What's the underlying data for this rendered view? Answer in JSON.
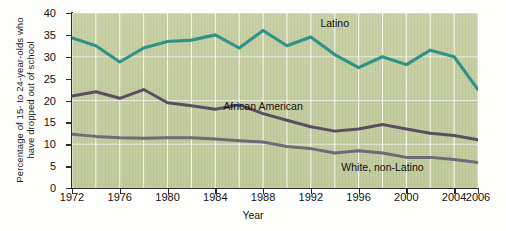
{
  "chart_data": {
    "type": "line",
    "title": "",
    "xlabel": "Year",
    "ylabel": "Percentage of 15- to 24-year-olds who have dropped out of school",
    "ylabel_line1": "Percentage of 15- to 24-year-olds who",
    "ylabel_line2": "have dropped out of school",
    "xlim": [
      1972,
      2006
    ],
    "ylim": [
      0,
      40
    ],
    "ytick_labels": [
      "0",
      "5",
      "10",
      "15",
      "20",
      "25",
      "30",
      "35",
      "40"
    ],
    "yticks": [
      0,
      5,
      10,
      15,
      20,
      25,
      30,
      35,
      40
    ],
    "xtick_labels": [
      "1972",
      "1976",
      "1980",
      "1984",
      "1988",
      "1992",
      "1996",
      "2000",
      "2004",
      "2006"
    ],
    "xticks": [
      1972,
      1976,
      1980,
      1984,
      1988,
      1992,
      1996,
      2000,
      2004,
      2006
    ],
    "grid": "vertical gridlines every 2 years, horizontal gridlines every 10 units",
    "grid_x_step": 2,
    "legend_position": "inline annotations on plot",
    "x": [
      1972,
      1974,
      1976,
      1978,
      1980,
      1982,
      1984,
      1986,
      1988,
      1990,
      1992,
      1994,
      1996,
      1998,
      2000,
      2002,
      2004,
      2006
    ],
    "series": [
      {
        "name": "Latino",
        "color": "#2e9287",
        "label_x": 1994,
        "label_y": 37.5,
        "values": [
          34.3,
          32.5,
          28.8,
          32.0,
          33.5,
          33.8,
          35.0,
          32.0,
          36.0,
          32.5,
          34.5,
          30.5,
          27.5,
          30.0,
          28.2,
          31.5,
          30.0,
          22.5
        ]
      },
      {
        "name": "African American",
        "color": "#5a4f5e",
        "label_x": 1988,
        "label_y": 18.5,
        "values": [
          21.0,
          22.0,
          20.5,
          22.5,
          19.5,
          18.8,
          18.0,
          19.0,
          17.0,
          15.5,
          14.0,
          13.0,
          13.5,
          14.5,
          13.5,
          12.5,
          12.0,
          11.0
        ]
      },
      {
        "name": "White, non-Latino",
        "color": "#6f6a76",
        "label_x": 1998,
        "label_y": 4.5,
        "values": [
          12.3,
          11.8,
          11.5,
          11.4,
          11.5,
          11.5,
          11.2,
          10.8,
          10.5,
          9.5,
          9.0,
          8.0,
          8.5,
          8.0,
          7.0,
          7.0,
          6.5,
          5.8
        ]
      }
    ]
  }
}
